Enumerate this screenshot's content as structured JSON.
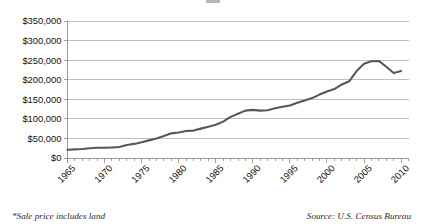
{
  "figure": {
    "footnote_left": "*Sale price includes land",
    "footnote_right": "Source: U.S. Census Bureau"
  },
  "chart_data": {
    "type": "line",
    "title": "",
    "subtitle": "",
    "xlabel": "",
    "ylabel": "",
    "xlim": [
      1965,
      2011
    ],
    "ylim": [
      0,
      350000
    ],
    "grid": true,
    "legend": false,
    "line_color": "#58585a",
    "y_ticks": [
      0,
      50000,
      100000,
      150000,
      200000,
      250000,
      300000,
      350000
    ],
    "y_tick_labels": [
      "$0",
      "$50,000",
      "$100,000",
      "$150,000",
      "$200,000",
      "$250,000",
      "$300,000",
      "$350,000"
    ],
    "x_ticks": [
      1965,
      1970,
      1975,
      1980,
      1985,
      1990,
      1995,
      2000,
      2005,
      2010
    ],
    "x_tick_labels": [
      "1965",
      "1970",
      "1975",
      "1980",
      "1985",
      "1990",
      "1995",
      "2000",
      "2005",
      "2010"
    ],
    "x_minor_tick_interval": 1,
    "series": [
      {
        "name": "Median sales price of new homes sold",
        "x": [
          1965,
          1966,
          1967,
          1968,
          1969,
          1970,
          1971,
          1972,
          1973,
          1974,
          1975,
          1976,
          1977,
          1978,
          1979,
          1980,
          1981,
          1982,
          1983,
          1984,
          1985,
          1986,
          1987,
          1988,
          1989,
          1990,
          1991,
          1992,
          1993,
          1994,
          1995,
          1996,
          1997,
          1998,
          1999,
          2000,
          2001,
          2002,
          2003,
          2004,
          2005,
          2006,
          2007,
          2008,
          2009,
          2010
        ],
        "values": [
          21000,
          22000,
          23000,
          25000,
          26000,
          26000,
          27000,
          28000,
          33000,
          36000,
          40000,
          45000,
          50000,
          56000,
          63000,
          65000,
          69000,
          70000,
          75000,
          80000,
          85000,
          93000,
          105000,
          113000,
          121000,
          123000,
          121000,
          122000,
          127000,
          131000,
          134000,
          141000,
          147000,
          153000,
          162000,
          170000,
          176000,
          188000,
          196000,
          222000,
          241000,
          247000,
          248000,
          233000,
          217000,
          222000
        ]
      }
    ]
  }
}
